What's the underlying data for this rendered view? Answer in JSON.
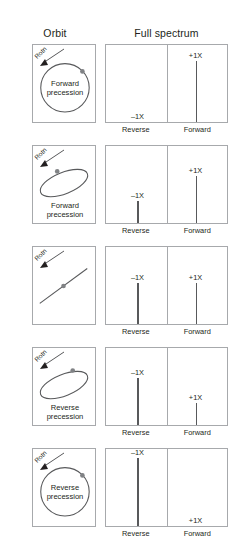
{
  "headers": {
    "orbit": "Orbit",
    "spectrum": "Full spectrum"
  },
  "axis": {
    "reverse": "Reverse",
    "forward": "Forward"
  },
  "labels": {
    "rotation": "Rotn",
    "neg_1x": "–1X",
    "pos_1x": "+1X",
    "forward_precession": "Forward\nprecession",
    "reverse_precession": "Reverse\nprecession"
  },
  "colors": {
    "line": "#58595b",
    "border": "#a7a9ac",
    "text": "#231f20"
  },
  "chart_data": {
    "type": "bar",
    "xlabel": "",
    "ylabel": "",
    "categories": [
      "–1X",
      "+1X"
    ],
    "axis_groups": [
      "Reverse",
      "Forward"
    ],
    "ylim": [
      0,
      1
    ],
    "grid": false,
    "legend": false,
    "rows": [
      {
        "index": 1,
        "orbit_shape": "circle",
        "orbit_label": "Forward\nprecession",
        "rotation_label": "Rotn",
        "rotation_direction": "counterclockwise",
        "values": [
          0.0,
          0.78
        ],
        "labels_shown": [
          "–1X",
          "+1X"
        ],
        "neg_label_position": "baseline",
        "description": "Pure forward circular orbit: only +1X component"
      },
      {
        "index": 2,
        "orbit_shape": "ellipse-forward",
        "orbit_label": "Forward\nprecession",
        "rotation_label": "Rotn",
        "rotation_direction": "counterclockwise",
        "values": [
          0.28,
          0.6
        ],
        "labels_shown": [
          "–1X",
          "+1X"
        ],
        "description": "Forward elliptical orbit: large +1X, small –1X"
      },
      {
        "index": 3,
        "orbit_shape": "line",
        "orbit_label": "",
        "rotation_label": "Rotn",
        "rotation_direction": "counterclockwise",
        "values": [
          0.52,
          0.52
        ],
        "labels_shown": [
          "–1X",
          "+1X"
        ],
        "description": "Straight-line orbit: equal –1X and +1X"
      },
      {
        "index": 4,
        "orbit_shape": "ellipse-reverse",
        "orbit_label": "Reverse\nprecession",
        "rotation_label": "Rotn",
        "rotation_direction": "counterclockwise",
        "values": [
          0.6,
          0.28
        ],
        "labels_shown": [
          "–1X",
          "+1X"
        ],
        "description": "Reverse elliptical orbit: large –1X, small +1X"
      },
      {
        "index": 5,
        "orbit_shape": "circle-reverse",
        "orbit_label": "Reverse\nprecession",
        "rotation_label": "Rotn",
        "rotation_direction": "counterclockwise",
        "values": [
          0.88,
          0.0
        ],
        "labels_shown": [
          "–1X",
          "+1X"
        ],
        "pos_label_position": "baseline",
        "description": "Pure reverse circular orbit: only –1X component"
      }
    ]
  }
}
